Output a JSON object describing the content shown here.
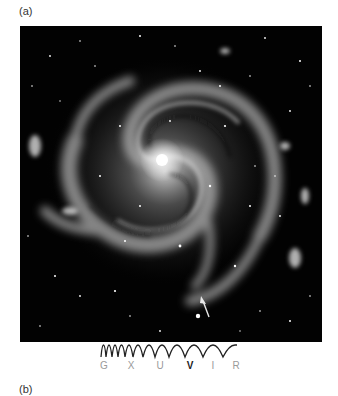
{
  "panels": {
    "a": {
      "label": "(a)"
    },
    "b": {
      "label": "(b)"
    }
  },
  "figure": {
    "background": "#020202",
    "core_color": "#f4f4f4",
    "arrow_color": "#e8e8e8"
  },
  "spectrum": {
    "bands": [
      {
        "label": "G",
        "active": false
      },
      {
        "label": "X",
        "active": false
      },
      {
        "label": "U",
        "active": false
      },
      {
        "label": "V",
        "active": true
      },
      {
        "label": "I",
        "active": false
      },
      {
        "label": "R",
        "active": false
      }
    ],
    "active_band": "V",
    "active_color": "#222222",
    "inactive_color": "#9a9a9a"
  }
}
